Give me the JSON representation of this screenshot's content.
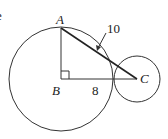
{
  "diagram": {
    "type": "geometry",
    "points": {
      "A": {
        "label": "A",
        "x": 61,
        "y": 28
      },
      "B": {
        "label": "B",
        "x": 61,
        "y": 79
      },
      "C": {
        "label": "C",
        "x": 137,
        "y": 79
      }
    },
    "segments": [
      {
        "from": "A",
        "to": "B"
      },
      {
        "from": "B",
        "to": "C"
      },
      {
        "from": "A",
        "to": "C"
      }
    ],
    "right_angle_at": "B",
    "circles": [
      {
        "center": "B",
        "radius": 52
      },
      {
        "center": "C",
        "radius": 23
      }
    ],
    "labels": {
      "a": "A",
      "b": "B",
      "c": "C",
      "bc_length": "8",
      "ac_length": "10"
    },
    "partial_text": "e",
    "stroke_color": "#333333"
  }
}
